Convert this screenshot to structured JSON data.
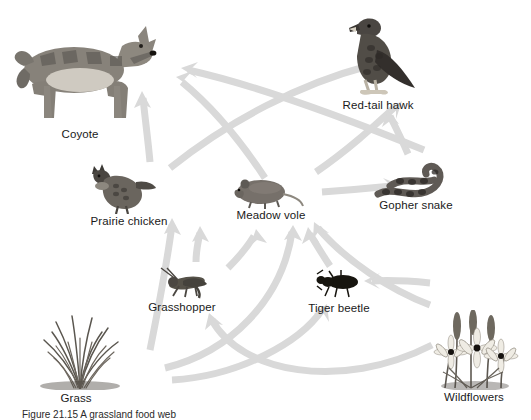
{
  "figure": {
    "title_text": "Grassland food web",
    "background_color": "#ffffff",
    "arrow_color": "#d9d9d9",
    "label_color": "#1a1a1a",
    "caption": "Figure  21.15  A grassland food web"
  },
  "organisms": [
    {
      "id": "coyote",
      "label": "Coyote",
      "icon": "coyote-icon",
      "label_x": 80,
      "label_y": 128,
      "art_x": 85,
      "art_y": 22,
      "art_w": 140,
      "art_h": 102
    },
    {
      "id": "red-tail-hawk",
      "label": "Red-tail hawk",
      "icon": "hawk-icon",
      "label_x": 378,
      "label_y": 99,
      "art_x": 380,
      "art_y": 16,
      "art_w": 92,
      "art_h": 78
    },
    {
      "id": "prairie-chicken",
      "label": "Prairie chicken",
      "icon": "prairie-chicken-icon",
      "label_x": 129,
      "label_y": 215,
      "art_x": 122,
      "art_y": 164,
      "art_w": 70,
      "art_h": 48
    },
    {
      "id": "meadow-vole",
      "label": "Meadow vole",
      "icon": "vole-icon",
      "label_x": 271,
      "label_y": 209,
      "art_x": 268,
      "art_y": 178,
      "art_w": 68,
      "art_h": 30
    },
    {
      "id": "gopher-snake",
      "label": "Gopher snake",
      "icon": "snake-icon",
      "label_x": 416,
      "label_y": 199,
      "art_x": 414,
      "art_y": 161,
      "art_w": 82,
      "art_h": 38
    },
    {
      "id": "grasshopper",
      "label": "Grasshopper",
      "icon": "grasshopper-icon",
      "label_x": 182,
      "label_y": 301,
      "art_x": 186,
      "art_y": 268,
      "art_w": 54,
      "art_h": 30
    },
    {
      "id": "tiger-beetle",
      "label": "Tiger beetle",
      "icon": "beetle-icon",
      "label_x": 339,
      "label_y": 302,
      "art_x": 339,
      "art_y": 270,
      "art_w": 48,
      "art_h": 28
    },
    {
      "id": "grass",
      "label": "Grass",
      "icon": "grass-icon",
      "label_x": 76,
      "label_y": 392,
      "art_x": 80,
      "art_y": 314,
      "art_w": 110,
      "art_h": 74
    },
    {
      "id": "wildflowers",
      "label": "Wildflowers",
      "icon": "wildflowers-icon",
      "label_x": 474,
      "label_y": 391,
      "art_x": 472,
      "art_y": 312,
      "art_w": 96,
      "art_h": 76
    }
  ],
  "food_web_links": [
    {
      "from": "grass",
      "to": "prairie-chicken"
    },
    {
      "from": "grass",
      "to": "grasshopper"
    },
    {
      "from": "grass",
      "to": "meadow-vole"
    },
    {
      "from": "grass",
      "to": "tiger-beetle"
    },
    {
      "from": "wildflowers",
      "to": "meadow-vole"
    },
    {
      "from": "wildflowers",
      "to": "tiger-beetle"
    },
    {
      "from": "wildflowers",
      "to": "grasshopper"
    },
    {
      "from": "grasshopper",
      "to": "prairie-chicken"
    },
    {
      "from": "grasshopper",
      "to": "meadow-vole"
    },
    {
      "from": "tiger-beetle",
      "to": "meadow-vole"
    },
    {
      "from": "meadow-vole",
      "to": "gopher-snake"
    },
    {
      "from": "meadow-vole",
      "to": "coyote"
    },
    {
      "from": "meadow-vole",
      "to": "red-tail-hawk"
    },
    {
      "from": "prairie-chicken",
      "to": "coyote"
    },
    {
      "from": "prairie-chicken",
      "to": "red-tail-hawk"
    },
    {
      "from": "gopher-snake",
      "to": "red-tail-hawk"
    },
    {
      "from": "gopher-snake",
      "to": "coyote"
    }
  ]
}
